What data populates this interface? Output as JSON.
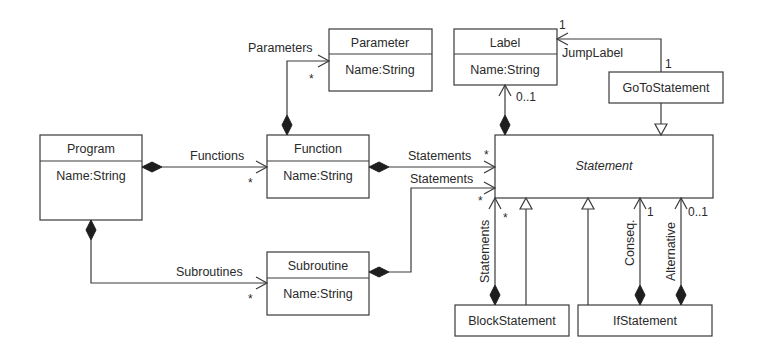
{
  "diagram": {
    "type": "UML class diagram",
    "classes": {
      "program": {
        "name": "Program",
        "attribute": "Name:String"
      },
      "function": {
        "name": "Function",
        "attribute": "Name:String"
      },
      "parameter": {
        "name": "Parameter",
        "attribute": "Name:String"
      },
      "subroutine": {
        "name": "Subroutine",
        "attribute": "Name:String"
      },
      "label": {
        "name": "Label",
        "attribute": "Name:String"
      },
      "statement": {
        "name": "Statement",
        "abstract": true
      },
      "goto": {
        "name": "GoToStatement"
      },
      "block": {
        "name": "BlockStatement"
      },
      "if": {
        "name": "IfStatement"
      }
    },
    "associations": {
      "functions": {
        "role": "Functions",
        "multiplicity": "*"
      },
      "subroutines": {
        "role": "Subroutines",
        "multiplicity": "*"
      },
      "parameters": {
        "role": "Parameters",
        "multiplicity": "*"
      },
      "func_statements": {
        "role": "Statements",
        "multiplicity": "*"
      },
      "sub_statements": {
        "role": "Statements",
        "multiplicity": "*"
      },
      "label": {
        "multiplicity": "0..1"
      },
      "jumplabel": {
        "role": "JumpLabel",
        "mult_target": "1",
        "mult_source": "1"
      },
      "block_statements": {
        "role": "Statements",
        "multiplicity": "*"
      },
      "conseq": {
        "role": "Conseq.",
        "multiplicity": "1"
      },
      "alternative": {
        "role": "Alternative",
        "multiplicity": "0..1"
      }
    }
  }
}
